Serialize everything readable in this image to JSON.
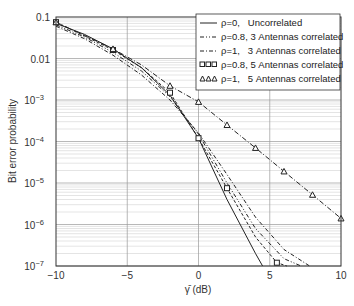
{
  "chart_data": {
    "type": "line",
    "title": "",
    "xlabel": "γ̄ (dB)",
    "ylabel": "Bit error probability",
    "xlim": [
      -10,
      10
    ],
    "ylim": [
      1e-07,
      0.1
    ],
    "yscale": "log",
    "grid": true,
    "legend_position": "upper right",
    "x_ticks": [
      "-10",
      "-5",
      "0",
      "5",
      "10"
    ],
    "y_ticks": [
      "0.1",
      "0.01",
      "10^-3",
      "10^-4",
      "10^-5",
      "10^-6",
      "10^-7"
    ],
    "series": [
      {
        "name": "ρ=0,   Uncorrelated",
        "style": "solid",
        "x": [
          -10,
          -8,
          -6,
          -4,
          -2,
          0,
          2,
          4,
          4.5
        ],
        "y": [
          0.07,
          0.038,
          0.017,
          0.006,
          0.0013,
          0.00012,
          4e-06,
          2e-07,
          1e-07
        ]
      },
      {
        "name": "ρ=0.8, 3 Antennas correlated",
        "style": "dash-dot-dot",
        "x": [
          -10,
          -8,
          -6,
          -4,
          -2,
          0,
          2,
          4,
          6,
          7.2
        ],
        "y": [
          0.065,
          0.033,
          0.014,
          0.005,
          0.0012,
          0.00015,
          1e-05,
          8e-07,
          1.5e-07,
          1e-07
        ]
      },
      {
        "name": "ρ=1,   3 Antennas correlated",
        "style": "dash-dot",
        "x": [
          -10,
          -8,
          -6,
          -4,
          -2,
          0,
          2,
          4,
          6,
          7.8
        ],
        "y": [
          0.06,
          0.03,
          0.012,
          0.004,
          0.001,
          0.00016,
          1.6e-05,
          1.5e-06,
          2.5e-07,
          1e-07
        ]
      },
      {
        "name": "ρ=0.8, 5 Antennas correlated",
        "style": "dashed-squares",
        "x": [
          -10,
          -8,
          -6,
          -4,
          -2,
          0,
          2,
          4,
          5.5,
          6.2
        ],
        "y": [
          0.075,
          0.035,
          0.016,
          0.006,
          0.0015,
          0.00012,
          7.5e-06,
          5e-07,
          1.2e-07,
          1e-07
        ]
      },
      {
        "name": "ρ=1,   5 Antennas correlated",
        "style": "dash-dot-triangles",
        "x": [
          -10,
          -8,
          -6,
          -4,
          -2,
          0,
          2,
          4,
          6,
          8,
          10
        ],
        "y": [
          0.075,
          0.036,
          0.017,
          0.007,
          0.0022,
          0.0009,
          0.00025,
          7e-05,
          1.9e-05,
          5.2e-06,
          1.4e-06
        ]
      }
    ]
  },
  "legend": {
    "items": [
      {
        "label": "ρ=0,   Uncorrelated"
      },
      {
        "label": "ρ=0.8, 3 Antennas correlated"
      },
      {
        "label": "ρ=1,   3 Antennas correlated"
      },
      {
        "label": "ρ=0.8, 5 Antennas correlated"
      },
      {
        "label": "ρ=1,   5 Antennas correlated"
      }
    ]
  },
  "axes": {
    "xlabel": "γ̄ (dB)",
    "ylabel": "Bit error probability",
    "x_ticks": [
      "−10",
      "−5",
      "0",
      "5",
      "10"
    ],
    "y_ticks": [
      {
        "base": "0.1",
        "exp": ""
      },
      {
        "base": "0.01",
        "exp": ""
      },
      {
        "base": "10",
        "exp": "−3"
      },
      {
        "base": "10",
        "exp": "−4"
      },
      {
        "base": "10",
        "exp": "−5"
      },
      {
        "base": "10",
        "exp": "−6"
      },
      {
        "base": "10",
        "exp": "−7"
      }
    ]
  }
}
